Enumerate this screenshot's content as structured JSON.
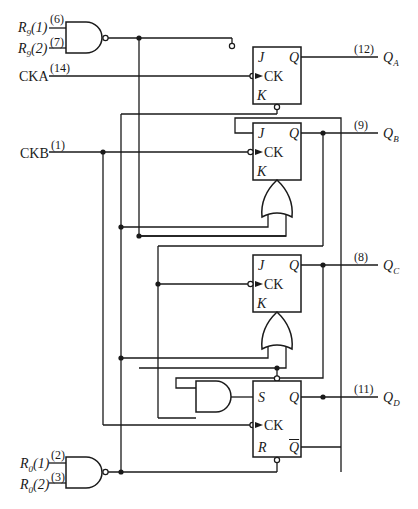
{
  "diagram": {
    "type": "asynchronous decade counter (74LS90-style) logic diagram",
    "inputs": {
      "r9_1": {
        "label": "R9(1)",
        "pin": "(6)"
      },
      "r9_2": {
        "label": "R9(2)",
        "pin": "(7)"
      },
      "cka": {
        "label": "CKA",
        "pin": "(14)"
      },
      "ckb": {
        "label": "CKB",
        "pin": "(1)"
      },
      "r0_1": {
        "label": "R0(1)",
        "pin": "(2)"
      },
      "r0_2": {
        "label": "R0(2)",
        "pin": "(3)"
      }
    },
    "outputs": {
      "qa": {
        "label": "QA",
        "pin": "(12)"
      },
      "qb": {
        "label": "QB",
        "pin": "(9)"
      },
      "qc": {
        "label": "QC",
        "pin": "(8)"
      },
      "qd": {
        "label": "QD",
        "pin": "(11)"
      }
    },
    "flipflops": [
      {
        "name": "FF-A",
        "type": "JK",
        "pins": {
          "j": "J",
          "ck": "CK",
          "k": "K",
          "q": "Q"
        }
      },
      {
        "name": "FF-B",
        "type": "JK",
        "pins": {
          "j": "J",
          "ck": "CK",
          "k": "K",
          "q": "Q"
        }
      },
      {
        "name": "FF-C",
        "type": "JK",
        "pins": {
          "j": "J",
          "ck": "CK",
          "k": "K",
          "q": "Q"
        }
      },
      {
        "name": "FF-D",
        "type": "SR",
        "pins": {
          "s": "S",
          "ck": "CK",
          "r": "R",
          "q": "Q",
          "qbar": "Q"
        }
      }
    ],
    "gates": [
      {
        "name": "R9 NAND",
        "type": "NAND"
      },
      {
        "name": "R0 NAND",
        "type": "NAND"
      },
      {
        "name": "FF-B K OR",
        "type": "OR"
      },
      {
        "name": "FF-C K OR",
        "type": "OR"
      },
      {
        "name": "FF-D S AND",
        "type": "AND"
      }
    ]
  }
}
